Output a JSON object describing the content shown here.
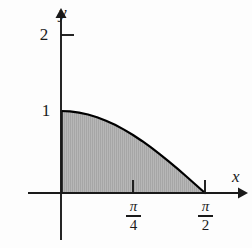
{
  "figure": {
    "kind": "cartesian-plot",
    "background_color": "#fdfdfd",
    "axis_color": "#1a1a1a",
    "curve_color": "#000000",
    "fill_color": "#b5b5b5",
    "fill_hatch_color": "#9a9a9a"
  },
  "axes": {
    "x_axis_label": "x",
    "y_axis_label": "y",
    "x_range_px": [
      28,
      245
    ],
    "y_range_px": [
      240,
      10
    ],
    "origin_px": [
      61,
      193
    ],
    "x_unit_px_per_quarter_pi": 72,
    "y_unit_px": 82,
    "grid": false,
    "legend": false
  },
  "ticks": {
    "x": [
      {
        "label_numerator": "π",
        "label_denominator": "4",
        "value_px": 133,
        "value": 0.7853981634
      },
      {
        "label_numerator": "π",
        "label_denominator": "2",
        "value_px": 205,
        "value": 1.5707963268
      }
    ],
    "y": [
      {
        "label": "1",
        "value": 1,
        "value_px": 111,
        "tick_drawn": false
      },
      {
        "label": "2",
        "value": 2,
        "value_px": 35,
        "tick_drawn": true
      }
    ]
  },
  "chart_data": {
    "type": "area",
    "title": "",
    "subtitle": "",
    "xlabel": "x",
    "ylabel": "y",
    "xlim": [
      0,
      1.5707963268
    ],
    "ylim": [
      0,
      2
    ],
    "grid": false,
    "legend_position": "none",
    "x_tick_labels": [
      "π/4",
      "π/2"
    ],
    "x_tick_values": [
      0.7853981634,
      1.5707963268
    ],
    "y_tick_labels": [
      "1",
      "2"
    ],
    "y_tick_values": [
      1,
      2
    ],
    "series": [
      {
        "name": "cos(x)",
        "expression": "y = cos(x)",
        "shaded": true,
        "shade_region": "between curve and x-axis from x = 0 to x = π/2",
        "x": [
          0,
          0.0981747704,
          0.1963495408,
          0.2945243113,
          0.3926990817,
          0.4908738521,
          0.5890486225,
          0.687223393,
          0.7853981634,
          0.8835729338,
          0.9817477042,
          1.0799224747,
          1.1780972451,
          1.2762720155,
          1.3744467859,
          1.4726215564,
          1.5707963268
        ],
        "y": [
          1,
          0.9951847267,
          0.9807852804,
          0.9569403357,
          0.9238795325,
          0.8819212643,
          0.8314696123,
          0.7730104534,
          0.7071067812,
          0.6343932842,
          0.555570233,
          0.4713967368,
          0.3826834324,
          0.2902846773,
          0.195090322,
          0.0980171403,
          0
        ]
      }
    ],
    "annotations": []
  }
}
